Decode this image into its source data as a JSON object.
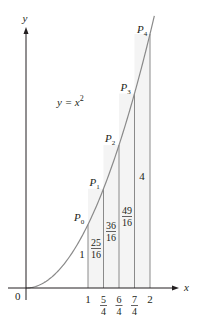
{
  "figure": {
    "curve_label": "y = x",
    "curve_label_exponent": "2",
    "axis_x_label": "x",
    "axis_y_label": "y",
    "origin_label": "0",
    "colors": {
      "axes": "#231f20",
      "curve": "#8a8a8a",
      "strip_lines": "#8a8a8a",
      "strip_fill": "#f4f4f4",
      "text": "#231f20"
    },
    "x_ticks": [
      {
        "value": 1,
        "num": "1",
        "den": ""
      },
      {
        "value": 1.25,
        "num": "5",
        "den": "4"
      },
      {
        "value": 1.5,
        "num": "6",
        "den": "4"
      },
      {
        "value": 1.75,
        "num": "7",
        "den": "4"
      },
      {
        "value": 2,
        "num": "2",
        "den": ""
      }
    ],
    "points": [
      {
        "name": "P",
        "sub": "0",
        "x": 1,
        "y": 1
      },
      {
        "name": "P",
        "sub": "1",
        "x": 1.25,
        "y": 1.5625
      },
      {
        "name": "P",
        "sub": "2",
        "x": 1.5,
        "y": 2.25
      },
      {
        "name": "P",
        "sub": "3",
        "x": 1.75,
        "y": 3.0625
      },
      {
        "name": "P",
        "sub": "4",
        "x": 2,
        "y": 4
      }
    ],
    "height_labels": [
      {
        "num": "1",
        "den": "",
        "x": 1
      },
      {
        "num": "25",
        "den": "16",
        "x": 1.25
      },
      {
        "num": "36",
        "den": "16",
        "x": 1.5
      },
      {
        "num": "49",
        "den": "16",
        "x": 1.75
      },
      {
        "num": "4",
        "den": "",
        "x": 2
      }
    ]
  }
}
